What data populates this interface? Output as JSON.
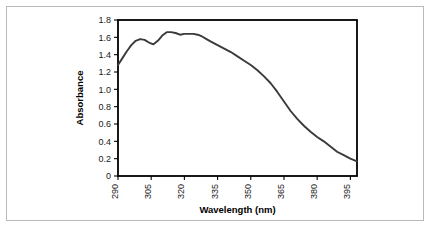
{
  "chart_data": {
    "type": "line",
    "title": "",
    "xlabel": "Wavelength (nm)",
    "ylabel": "Absorbance",
    "xlim": [
      290,
      398
    ],
    "ylim": [
      0,
      1.8
    ],
    "grid": false,
    "legend": null,
    "xticks": [
      290,
      305,
      320,
      335,
      350,
      365,
      380,
      395
    ],
    "xtick_labels": [
      "290",
      "305",
      "320",
      "335",
      "350",
      "365",
      "380",
      "395"
    ],
    "xtick_rotation": 90,
    "yticks": [
      0,
      0.2,
      0.4,
      0.6,
      0.8,
      1.0,
      1.2,
      1.4,
      1.6,
      1.8
    ],
    "ytick_labels": [
      "0",
      "0.2",
      "0.4",
      "0.6",
      "0.8",
      "1.0",
      "1.2",
      "1.4",
      "1.6",
      "1.8"
    ],
    "series": [
      {
        "name": "absorbance-spectrum",
        "color": "#3a3a3a",
        "x": [
          290,
          292,
          294,
          296,
          298,
          300,
          302,
          304,
          306,
          308,
          310,
          312,
          314,
          316,
          318,
          320,
          322,
          324,
          326,
          328,
          330,
          332,
          335,
          338,
          341,
          344,
          347,
          350,
          353,
          356,
          359,
          362,
          365,
          368,
          371,
          374,
          377,
          380,
          383,
          386,
          389,
          392,
          395,
          398
        ],
        "values": [
          1.28,
          1.36,
          1.44,
          1.51,
          1.56,
          1.58,
          1.57,
          1.54,
          1.52,
          1.56,
          1.62,
          1.66,
          1.66,
          1.65,
          1.63,
          1.64,
          1.64,
          1.64,
          1.63,
          1.61,
          1.58,
          1.55,
          1.51,
          1.47,
          1.43,
          1.38,
          1.33,
          1.28,
          1.22,
          1.15,
          1.07,
          0.97,
          0.86,
          0.75,
          0.66,
          0.58,
          0.51,
          0.45,
          0.4,
          0.34,
          0.28,
          0.24,
          0.2,
          0.17
        ]
      }
    ]
  },
  "figure": {
    "border_color": "#b9b9b9",
    "background": "#ffffff",
    "axis_color": "#000000"
  }
}
